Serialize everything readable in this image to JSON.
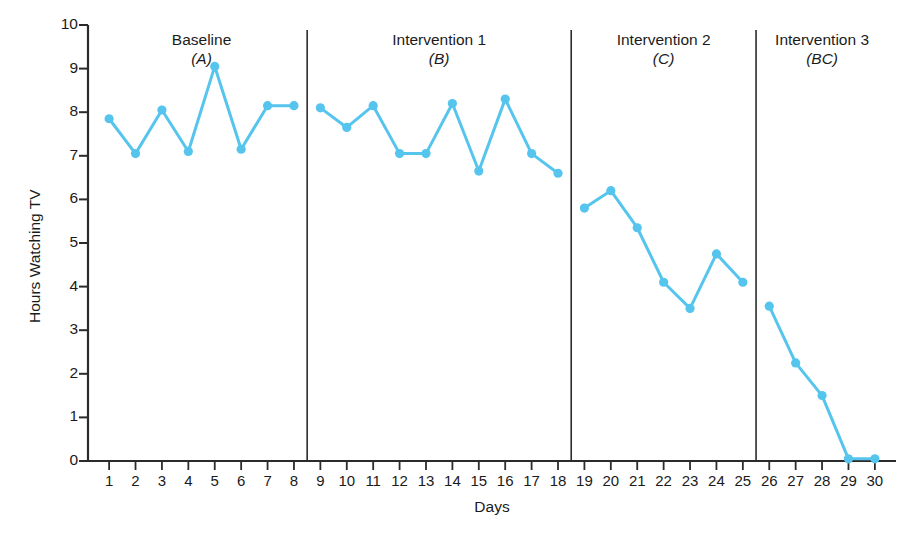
{
  "chart_data": {
    "type": "line",
    "title": "",
    "xlabel": "Days",
    "ylabel": "Hours Watching TV",
    "xlim": [
      0.2,
      30.8
    ],
    "ylim": [
      0,
      10
    ],
    "grid": false,
    "legend": "none",
    "series_color": "#56C5EE",
    "x_ticks": [
      1,
      2,
      3,
      4,
      5,
      6,
      7,
      8,
      9,
      10,
      11,
      12,
      13,
      14,
      15,
      16,
      17,
      18,
      19,
      20,
      21,
      22,
      23,
      24,
      25,
      26,
      27,
      28,
      29,
      30
    ],
    "y_ticks": [
      0,
      1,
      2,
      3,
      4,
      5,
      6,
      7,
      8,
      9,
      10
    ],
    "x": [
      1,
      2,
      3,
      4,
      5,
      6,
      7,
      8,
      9,
      10,
      11,
      12,
      13,
      14,
      15,
      16,
      17,
      18,
      19,
      20,
      21,
      22,
      23,
      24,
      25,
      26,
      27,
      28,
      29,
      30
    ],
    "phases": [
      {
        "name": "Baseline",
        "code": "(A)",
        "x_start": 1,
        "x_end": 8,
        "x": [
          1,
          2,
          3,
          4,
          5,
          6,
          7,
          8
        ],
        "values": [
          7.85,
          7.05,
          8.05,
          7.1,
          9.05,
          7.15,
          8.15,
          8.15
        ]
      },
      {
        "name": "Intervention 1",
        "code": "(B)",
        "x_start": 9,
        "x_end": 18,
        "x": [
          9,
          10,
          11,
          12,
          13,
          14,
          15,
          16,
          17,
          18
        ],
        "values": [
          8.1,
          7.65,
          8.15,
          7.05,
          7.05,
          8.2,
          6.65,
          8.3,
          7.05,
          6.6
        ]
      },
      {
        "name": "Intervention 2",
        "code": "(C)",
        "x_start": 19,
        "x_end": 25,
        "x": [
          19,
          20,
          21,
          22,
          23,
          24,
          25
        ],
        "values": [
          5.8,
          6.2,
          5.35,
          4.1,
          3.5,
          4.75,
          4.1
        ]
      },
      {
        "name": "Intervention 3",
        "code": "(BC)",
        "x_start": 26,
        "x_end": 30,
        "x": [
          26,
          27,
          28,
          29,
          30
        ],
        "values": [
          3.55,
          2.25,
          1.5,
          0.05,
          0.05
        ]
      }
    ],
    "phase_dividers": [
      8.5,
      18.5,
      25.5
    ],
    "axis_color": "#2b2b2b"
  }
}
